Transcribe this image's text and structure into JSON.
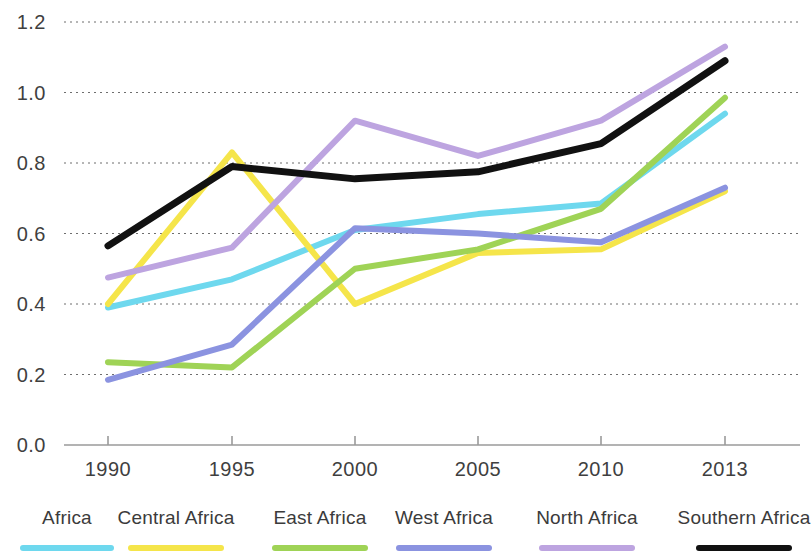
{
  "chart_data": {
    "type": "line",
    "title": "",
    "subtitle": "",
    "xlabel": "",
    "ylabel": "",
    "x": [
      1990,
      1995,
      2000,
      2005,
      2010,
      2013
    ],
    "xtick_labels": [
      "1990",
      "1995",
      "2000",
      "2005",
      "2010",
      "2013"
    ],
    "ytick_labels": [
      "0.0",
      "0.2",
      "0.4",
      "0.6",
      "0.8",
      "1.0",
      "1.2"
    ],
    "ytick_values": [
      0.0,
      0.2,
      0.4,
      0.6,
      0.8,
      1.0,
      1.2
    ],
    "ylim": [
      0.0,
      1.2
    ],
    "grid": "horizontal-dotted",
    "legend_position": "bottom",
    "series": [
      {
        "name": "Africa",
        "color": "#6ed8ee",
        "values": [
          0.39,
          0.47,
          0.61,
          0.655,
          0.685,
          0.94
        ]
      },
      {
        "name": "Central Africa",
        "color": "#f5e54a",
        "values": [
          0.4,
          0.83,
          0.4,
          0.545,
          0.555,
          0.72
        ]
      },
      {
        "name": "East Africa",
        "color": "#9fd356",
        "values": [
          0.235,
          0.22,
          0.5,
          0.555,
          0.67,
          0.985
        ]
      },
      {
        "name": "West Africa",
        "color": "#8b93e0",
        "values": [
          0.185,
          0.285,
          0.615,
          0.6,
          0.575,
          0.73
        ]
      },
      {
        "name": "North Africa",
        "color": "#bda4e0",
        "values": [
          0.475,
          0.56,
          0.92,
          0.82,
          0.92,
          1.13
        ]
      },
      {
        "name": "Southern Africa",
        "color": "#111111",
        "values": [
          0.565,
          0.79,
          0.755,
          0.775,
          0.855,
          1.09
        ]
      }
    ]
  },
  "legend": {
    "items": [
      {
        "label": "Africa",
        "color": "#6ed8ee"
      },
      {
        "label": "Central Africa",
        "color": "#f5e54a"
      },
      {
        "label": "East Africa",
        "color": "#9fd356"
      },
      {
        "label": "West Africa",
        "color": "#8b93e0"
      },
      {
        "label": "North Africa",
        "color": "#bda4e0"
      },
      {
        "label": "Southern Africa",
        "color": "#111111"
      }
    ]
  },
  "axes": {
    "axis_color": "#9a9a9a",
    "grid_color": "#555555"
  }
}
